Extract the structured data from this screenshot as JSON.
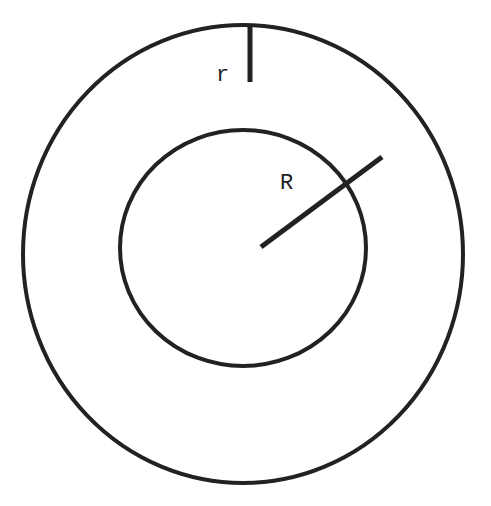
{
  "diagram": {
    "type": "concentric-circles",
    "stroke_color": "#222222",
    "background": "#ffffff",
    "outer_circle": {
      "cx": 243,
      "cy": 254,
      "rx": 220,
      "ry": 229
    },
    "inner_circle": {
      "cx": 243,
      "cy": 248,
      "rx": 123,
      "ry": 118
    },
    "labels": {
      "small_r": "r",
      "big_R": "R"
    }
  }
}
